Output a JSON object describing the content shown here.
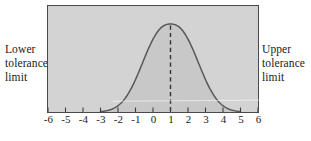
{
  "labels": {
    "lower": "Lower tolerance limit",
    "upper": "Upper tolerance limit"
  },
  "chart_data": {
    "type": "area",
    "title": "",
    "xlabel": "",
    "ylabel": "",
    "xlim": [
      -6,
      6
    ],
    "x_ticks": [
      -6,
      -5,
      -4,
      -3,
      -2,
      -1,
      0,
      1,
      2,
      3,
      4,
      5,
      6
    ],
    "grid": false,
    "legend": "none",
    "curve": {
      "shape": "bell",
      "mean": 1,
      "sigma": 1.5,
      "exponent": 2.4,
      "visible_x_range": [
        -3.0,
        5.0
      ],
      "peak_fraction_of_plot_height": 0.83
    },
    "dashed_mean_line_x": 1,
    "annotations": [
      "Lower tolerance limit",
      "Upper tolerance limit"
    ]
  },
  "colors": {
    "plot_background": "#d3d3d3",
    "plot_border": "#4a4a4a",
    "curve_stroke": "#585858",
    "curve_fill": "rgba(0,0,0,0.05)",
    "dashed_line": "#333333",
    "tick_color": "#3d3d3d",
    "text_color": "#1a1a1a"
  }
}
